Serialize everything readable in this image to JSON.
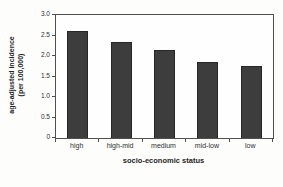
{
  "figure": {
    "background_color": "#fdfdfc",
    "bar_color": "#3d3d3d",
    "bar_border_color": "#272727",
    "frame_color": "#4f4f4f",
    "text_color": "#2e2e2e"
  },
  "chart_data": {
    "type": "bar",
    "title": "",
    "categories": [
      "high",
      "high-mid",
      "medium",
      "mid-low",
      "low"
    ],
    "values": [
      2.6,
      2.35,
      2.15,
      1.85,
      1.75
    ],
    "xlabel": "socio-economic status",
    "ylabel_line1": "age-adjusted incidence",
    "ylabel_line2": "(per 100,000)",
    "ylim": [
      0,
      3.0
    ],
    "yticks": [
      0,
      0.5,
      1.0,
      1.5,
      2.0,
      2.5,
      3.0
    ],
    "ytick_labels": [
      "0",
      "0.5",
      "1.0",
      "1.5",
      "2.0",
      "2.5",
      "3.0"
    ],
    "grid": false,
    "legend": false,
    "legend_position": "none"
  }
}
